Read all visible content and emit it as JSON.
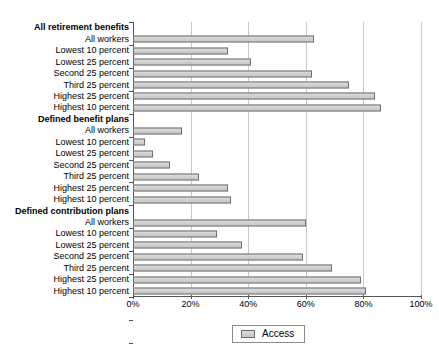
{
  "chart_data": {
    "type": "bar",
    "orientation": "horizontal",
    "title": "",
    "xlabel": "",
    "ylabel": "",
    "xlim": [
      0,
      100
    ],
    "xticks": [
      0,
      20,
      40,
      60,
      80,
      100
    ],
    "xtick_labels": [
      "0%",
      "20%",
      "40%",
      "60%",
      "80%",
      "100%"
    ],
    "grid": "vertical",
    "legend": {
      "position": "bottom-center",
      "entries": [
        {
          "name": "Access",
          "color": "#d2d2d2"
        }
      ]
    },
    "series_name": "Access",
    "groups": [
      {
        "header": "All retirement benefits",
        "categories": [
          "All workers",
          "Lowest 10 percent",
          "Lowest 25 percent",
          "Second 25 percent",
          "Third 25 percent",
          "Highest 25 percent",
          "Highest 10 percent"
        ],
        "values": [
          63,
          33,
          41,
          62,
          75,
          84,
          86
        ]
      },
      {
        "header": "Defined benefit plans",
        "categories": [
          "All workers",
          "Lowest 10 percent",
          "Lowest 25 percent",
          "Second 25 percent",
          "Third 25 percent",
          "Highest 25 percent",
          "Highest 10 percent"
        ],
        "values": [
          17,
          4,
          7,
          13,
          23,
          33,
          34
        ]
      },
      {
        "header": "Defined contribution plans",
        "categories": [
          "All workers",
          "Lowest 10 percent",
          "Lowest 25 percent",
          "Second 25 percent",
          "Third 25 percent",
          "Highest 25 percent",
          "Highest 10 percent"
        ],
        "values": [
          60,
          29,
          38,
          59,
          69,
          79,
          81
        ]
      }
    ]
  }
}
